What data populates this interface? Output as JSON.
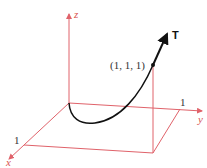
{
  "diagram": {
    "type": "3d-curve-with-tangent",
    "axes": {
      "x_label": "x",
      "y_label": "y",
      "z_label": "z",
      "x_tick": "1",
      "y_tick": "1"
    },
    "point_label": "(1, 1, 1)",
    "tangent_label": "T",
    "colors": {
      "axes": "#e0626a",
      "curve": "#111111",
      "tangent": "#111111"
    }
  }
}
